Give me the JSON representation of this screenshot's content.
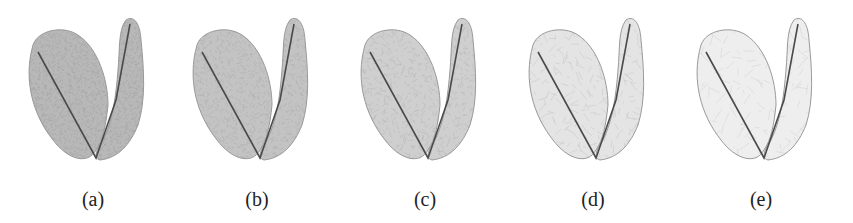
{
  "figure": {
    "panels": [
      {
        "label": "(a)",
        "density": "very-dense",
        "fill": "#b8b8b8",
        "mesh_opacity": 0.55,
        "mesh_step": 3
      },
      {
        "label": "(b)",
        "density": "dense",
        "fill": "#c4c4c4",
        "mesh_opacity": 0.45,
        "mesh_step": 4
      },
      {
        "label": "(c)",
        "density": "medium",
        "fill": "#cfcfcf",
        "mesh_opacity": 0.4,
        "mesh_step": 5
      },
      {
        "label": "(d)",
        "density": "sparse",
        "fill": "#e4e4e4",
        "mesh_opacity": 0.35,
        "mesh_step": 8
      },
      {
        "label": "(e)",
        "density": "very-sparse",
        "fill": "#eeeeee",
        "mesh_opacity": 0.3,
        "mesh_step": 11
      }
    ],
    "colors": {
      "skeleton": "#4a4a4a",
      "outline": "#9a9a9a",
      "mesh": "#8a8a8a",
      "caption": "#222222"
    }
  }
}
